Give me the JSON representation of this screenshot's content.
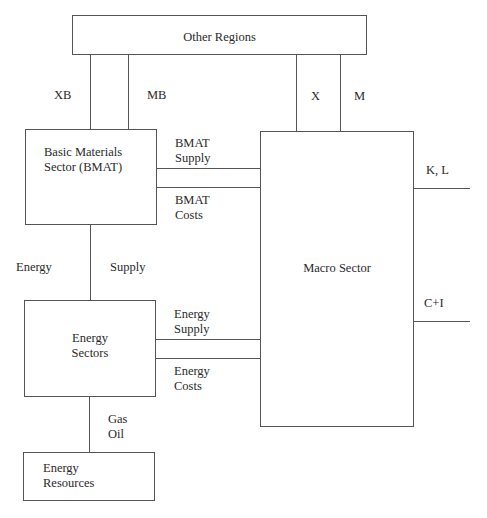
{
  "diagram": {
    "nodes": {
      "other_regions": {
        "label": "Other Regions"
      },
      "bmat": {
        "line1": "Basic Materials",
        "line2": "Sector (BMAT)"
      },
      "macro": {
        "label": "Macro Sector"
      },
      "energy_sectors": {
        "line1": "Energy",
        "line2": "Sectors"
      },
      "energy_resources": {
        "line1": "Energy",
        "line2": "Resources"
      }
    },
    "edges": {
      "xb": {
        "label": "XB"
      },
      "mb": {
        "label": "MB"
      },
      "x": {
        "label": "X"
      },
      "m": {
        "label": "M"
      },
      "bmat_supply": {
        "line1": "BMAT",
        "line2": "Supply"
      },
      "bmat_costs": {
        "line1": "BMAT",
        "line2": "Costs"
      },
      "kl": {
        "label": "K, L"
      },
      "ci": {
        "label": "C+I"
      },
      "energy_supply_vertical": {
        "left": "Energy",
        "right": "Supply"
      },
      "energy_supply": {
        "line1": "Energy",
        "line2": "Supply"
      },
      "energy_costs": {
        "line1": "Energy",
        "line2": "Costs"
      },
      "gas_oil": {
        "line1": "Gas",
        "line2": "Oil"
      }
    },
    "colors": {
      "line": "#555555",
      "text": "#2a2a2a",
      "background": "#ffffff"
    }
  }
}
